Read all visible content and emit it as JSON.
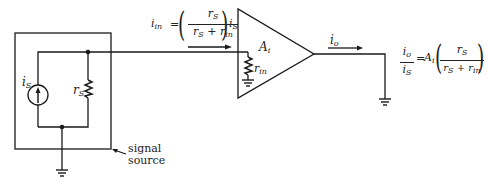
{
  "diagram": {
    "source_box_label_line1": "signal",
    "source_box_label_line2": "source",
    "current_source_label": "i",
    "current_source_sub": "S",
    "source_resistor_label": "r",
    "source_resistor_sub": "S",
    "amplifier_gain_label": "A",
    "amplifier_gain_sub": "i",
    "input_resistor_label": "r",
    "input_resistor_sub": "in",
    "output_current_label": "i",
    "output_current_sub": "o",
    "input_equation": {
      "lhs": "i",
      "lhs_sub": "in",
      "equals": "=",
      "num": "r",
      "num_sub": "S",
      "den_a": "r",
      "den_a_sub": "S",
      "den_plus": " + ",
      "den_b": "r",
      "den_b_sub": "in",
      "rhs": "i",
      "rhs_sub": "S"
    },
    "output_equation": {
      "lhs_num": "i",
      "lhs_num_sub": "o",
      "lhs_den": "i",
      "lhs_den_sub": "S",
      "equals": "=",
      "gain": "A",
      "gain_sub": "i",
      "num": "r",
      "num_sub": "S",
      "den_a": "r",
      "den_a_sub": "S",
      "den_plus": " + ",
      "den_b": "r",
      "den_b_sub": "in"
    },
    "colors": {
      "line": "#1a1a1a",
      "background": "#ffffff"
    }
  }
}
